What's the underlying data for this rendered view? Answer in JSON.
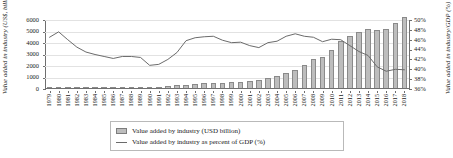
{
  "chart_data": {
    "type": "bar",
    "title": "",
    "xlabel": "",
    "ylabel": "Value added in industry (US$, billion)",
    "y2label": "Value added in industry/GDP (%)",
    "ylim": [
      0,
      6000
    ],
    "y2lim": [
      36,
      50
    ],
    "grid": true,
    "legend_position": "bottom",
    "yticks": [
      "0",
      "1000",
      "2000",
      "3000",
      "4000",
      "5000",
      "6000"
    ],
    "y2ticks": [
      "36%",
      "38%",
      "40%",
      "42%",
      "44%",
      "46%",
      "48%",
      "50%"
    ],
    "categories": [
      "1979",
      "1980",
      "1981",
      "1982",
      "1983",
      "1984",
      "1985",
      "1986",
      "1987",
      "1988",
      "1989",
      "1990",
      "1991",
      "1992",
      "1993",
      "1994",
      "1995",
      "1996",
      "1997",
      "1998",
      "1999",
      "2000",
      "2001",
      "2002",
      "2003",
      "2004",
      "2005",
      "2006",
      "2007",
      "2008",
      "2009",
      "2010",
      "2011",
      "2012",
      "2013",
      "2014",
      "2015",
      "2016",
      "2017",
      "2018"
    ],
    "series": [
      {
        "name": "Value added by industry (USD billion)",
        "type": "bar",
        "axis": "left",
        "color": "#bdbdbd",
        "values": [
          80,
          90,
          100,
          105,
          115,
          130,
          140,
          135,
          145,
          175,
          200,
          195,
          215,
          260,
          310,
          360,
          440,
          500,
          540,
          550,
          570,
          630,
          700,
          770,
          920,
          1120,
          1350,
          1650,
          2080,
          2600,
          2800,
          3400,
          4200,
          4600,
          5000,
          5250,
          5100,
          5200,
          5700,
          6300
        ]
      },
      {
        "name": "Value added by industry as percent of GDP (%)",
        "type": "line",
        "axis": "right",
        "color": "#6b6b6b",
        "values": [
          46.5,
          47.6,
          46.0,
          44.5,
          43.5,
          43.0,
          42.6,
          42.2,
          42.6,
          42.6,
          42.4,
          40.8,
          41.0,
          42.0,
          43.4,
          45.8,
          46.4,
          46.6,
          46.7,
          45.9,
          45.4,
          45.5,
          44.8,
          44.4,
          45.4,
          45.7,
          46.7,
          47.2,
          46.7,
          46.5,
          45.6,
          46.1,
          46.0,
          44.8,
          43.6,
          42.8,
          40.5,
          39.6,
          40.0,
          39.9
        ]
      }
    ]
  },
  "legend": {
    "items": [
      {
        "label": "Value added by industry (USD billion)",
        "marker": "bar-swatch"
      },
      {
        "label": "Value added by industry as percent of GDP (%)",
        "marker": "line-swatch"
      }
    ]
  }
}
